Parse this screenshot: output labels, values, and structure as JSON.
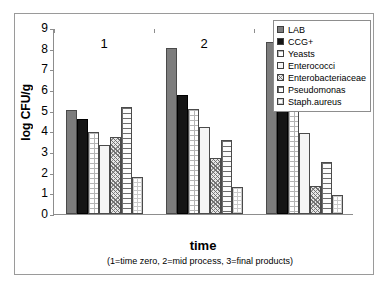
{
  "chart_data": {
    "type": "bar",
    "title": "",
    "xlabel": "time",
    "ylabel": "log CFU/g",
    "caption": "(1=time zero, 2=mid process, 3=final products)",
    "categories": [
      "1",
      "2",
      "3"
    ],
    "ylim": [
      0,
      9
    ],
    "yticks": [
      "0",
      "1",
      "2",
      "3",
      "4",
      "5",
      "6",
      "7",
      "8",
      "9"
    ],
    "grid": false,
    "legend_position": "top-right",
    "series": [
      {
        "name": "LAB",
        "values": [
          5.05,
          8.05,
          8.3
        ],
        "pattern": "solid-gray",
        "color": "#7d7d7d"
      },
      {
        "name": "CCG+",
        "values": [
          4.6,
          5.75,
          6.05
        ],
        "pattern": "solid-black",
        "color": "#151515"
      },
      {
        "name": "Yeasts",
        "values": [
          3.95,
          5.1,
          5.75
        ],
        "pattern": "fine-grid",
        "color": "#ffffff"
      },
      {
        "name": "Enterococci",
        "values": [
          3.35,
          4.2,
          3.9
        ],
        "pattern": "plain-white",
        "color": "#f4f4f4"
      },
      {
        "name": "Enterobacteriaceae",
        "values": [
          3.75,
          2.7,
          1.35
        ],
        "pattern": "crosshatch",
        "color": "#e8e8e8"
      },
      {
        "name": "Pseudomonas",
        "values": [
          5.2,
          3.6,
          2.5
        ],
        "pattern": "brick",
        "color": "#fbfbfb"
      },
      {
        "name": "Staph.aureus",
        "values": [
          1.8,
          1.3,
          0.9
        ],
        "pattern": "light-dots",
        "color": "#ffffff"
      }
    ]
  }
}
